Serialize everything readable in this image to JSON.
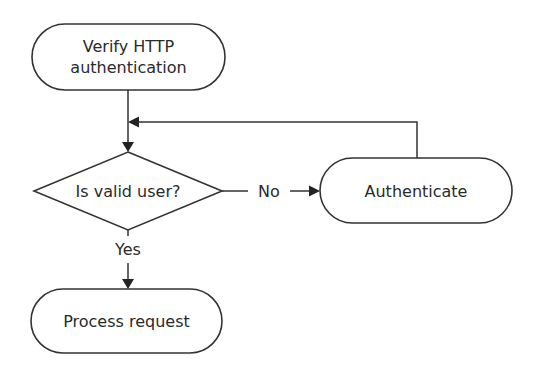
{
  "diagram": {
    "type": "flowchart",
    "nodes": {
      "verify": {
        "line1": "Verify HTTP",
        "line2": "authentication",
        "shape": "terminator"
      },
      "decision": {
        "label": "Is valid user?",
        "shape": "diamond"
      },
      "authenticate": {
        "label": "Authenticate",
        "shape": "terminator"
      },
      "process": {
        "label": "Process request",
        "shape": "terminator"
      }
    },
    "edges": {
      "verify_to_decision": {
        "from": "verify",
        "to": "decision",
        "label": ""
      },
      "decision_no": {
        "from": "decision",
        "to": "authenticate",
        "label": "No"
      },
      "authenticate_loop": {
        "from": "authenticate",
        "to": "decision",
        "label": ""
      },
      "decision_yes": {
        "from": "decision",
        "to": "process",
        "label": "Yes"
      }
    },
    "colors": {
      "stroke": "#333333",
      "text": "#2a2a2a",
      "background": "#ffffff"
    }
  }
}
